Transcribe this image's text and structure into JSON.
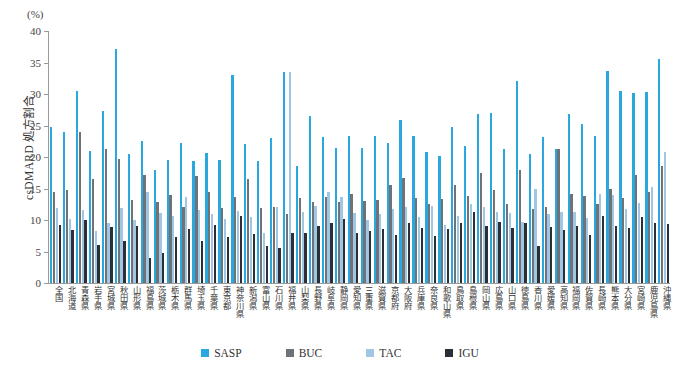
{
  "figure": {
    "unit_label": "(%)",
    "y_axis_title": "csDMARD 処方割合"
  },
  "legend": {
    "position": "bottom-center",
    "items": [
      {
        "label": "SASP",
        "color": "#29a8e0"
      },
      {
        "label": "BUC",
        "color": "#6f7276"
      },
      {
        "label": "TAC",
        "color": "#9fc6e3"
      },
      {
        "label": "IGU",
        "color": "#2b2f36"
      }
    ]
  },
  "chart_data": {
    "type": "bar",
    "title": "",
    "subtitle": "",
    "xlabel": "",
    "ylabel": "csDMARD 処方割合",
    "yunit": "(%)",
    "ylim": [
      0,
      40
    ],
    "yticks": [
      0,
      5,
      10,
      15,
      20,
      25,
      30,
      35,
      40
    ],
    "grid": false,
    "legend_position": "bottom-center",
    "categories": [
      "全国",
      "北海道",
      "青森県",
      "岩手県",
      "宮城県",
      "秋田県",
      "山形県",
      "福島県",
      "茨城県",
      "栃木県",
      "群馬県",
      "埼玉県",
      "千葉県",
      "東京都",
      "神奈川県",
      "新潟県",
      "富山県",
      "石川県",
      "福井県",
      "山梨県",
      "長野県",
      "岐阜県",
      "静岡県",
      "愛知県",
      "三重県",
      "滋賀県",
      "京都府",
      "大阪府",
      "兵庫県",
      "奈良県",
      "和歌山県",
      "鳥取県",
      "島根県",
      "岡山県",
      "広島県",
      "山口県",
      "徳島県",
      "香川県",
      "愛媛県",
      "高知県",
      "福岡県",
      "佐賀県",
      "長崎県",
      "熊本県",
      "大分県",
      "宮崎県",
      "鹿児島県",
      "沖縄県"
    ],
    "series": [
      {
        "name": "SASP",
        "color": "#29a8e0",
        "values": [
          24.8,
          24.0,
          30.5,
          20.9,
          27.3,
          37.1,
          20.4,
          22.6,
          18.0,
          19.6,
          22.2,
          19.4,
          20.6,
          19.6,
          33.0,
          22.1,
          19.4,
          23.0,
          33.5,
          18.6,
          26.5,
          23.2,
          21.4,
          23.3,
          21.5,
          23.4,
          22.3,
          25.8,
          23.3,
          20.8,
          20.1,
          24.7,
          21.7,
          26.8,
          27.0,
          21.2,
          32.0,
          20.4,
          23.2,
          21.3,
          26.9,
          25.2,
          23.3,
          33.6,
          30.5,
          30.2,
          30.3,
          35.6
        ]
      },
      {
        "name": "BUC",
        "color": "#6f7276",
        "values": [
          14.4,
          14.8,
          23.9,
          16.5,
          21.3,
          19.7,
          13.2,
          17.2,
          12.8,
          14.0,
          12.0,
          17.0,
          14.4,
          11.9,
          13.7,
          16.5,
          11.9,
          12.0,
          11.0,
          13.5,
          12.9,
          13.6,
          12.8,
          14.1,
          13.0,
          13.2,
          15.5,
          16.7,
          13.5,
          12.6,
          13.3,
          15.6,
          13.8,
          17.5,
          14.7,
          12.5,
          18.0,
          11.8,
          12.0,
          21.2,
          14.2,
          13.8,
          12.5,
          14.9,
          13.5,
          17.2,
          14.4,
          18.6
        ]
      },
      {
        "name": "TAC",
        "color": "#9fc6e3",
        "values": [
          11.9,
          10.2,
          11.6,
          8.3,
          9.5,
          11.9,
          10.0,
          14.5,
          11.1,
          10.6,
          13.6,
          11.6,
          10.9,
          10.2,
          11.5,
          10.5,
          8.0,
          12.0,
          33.5,
          11.3,
          12.2,
          14.5,
          13.6,
          11.1,
          10.0,
          11.0,
          11.7,
          12.1,
          10.5,
          12.2,
          9.2,
          10.7,
          12.5,
          12.0,
          11.3,
          11.1,
          9.7,
          14.9,
          10.9,
          11.3,
          11.3,
          10.3,
          14.2,
          14.0,
          11.8,
          12.7,
          15.3,
          20.8
        ]
      },
      {
        "name": "IGU",
        "color": "#2b2f36",
        "values": [
          9.2,
          8.4,
          10.0,
          6.1,
          8.9,
          6.7,
          9.0,
          3.9,
          4.7,
          7.3,
          8.6,
          6.7,
          9.2,
          7.3,
          10.7,
          7.8,
          5.9,
          5.6,
          8.0,
          7.9,
          9.0,
          9.5,
          10.2,
          8.0,
          8.2,
          8.5,
          7.6,
          9.6,
          8.8,
          7.5,
          8.5,
          9.6,
          11.2,
          9.1,
          9.7,
          8.8,
          9.5,
          5.9,
          8.9,
          8.4,
          9.1,
          7.6,
          10.7,
          9.1,
          8.7,
          10.4,
          9.5,
          9.4
        ]
      }
    ]
  }
}
